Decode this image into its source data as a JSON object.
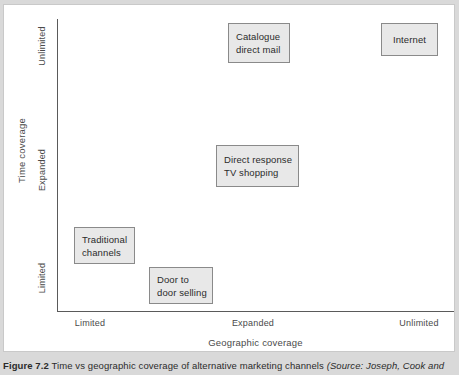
{
  "figure": {
    "caption_label": "Figure 7.2",
    "caption_text": "Time vs geographic coverage of alternative marketing channels",
    "caption_source": "(Source: Joseph, Cook and"
  },
  "chart_data": {
    "type": "scatter",
    "title": "Time vs geographic coverage of alternative marketing channels",
    "xlabel": "Geographic coverage",
    "ylabel": "Time coverage",
    "x_tick_labels": [
      "Limited",
      "Expanded",
      "Unlimited"
    ],
    "y_tick_labels": [
      "Limited",
      "Expanded",
      "Unlimited"
    ],
    "grid": false,
    "legend": "none",
    "points": [
      {
        "label": "Catalogue\ndirect mail",
        "x": "Expanded",
        "y": "Unlimited"
      },
      {
        "label": "Internet",
        "x": "Unlimited",
        "y": "Unlimited"
      },
      {
        "label": "Direct response\nTV shopping",
        "x": "Expanded",
        "y": "Expanded"
      },
      {
        "label": "Traditional\nchannels",
        "x": "Limited",
        "y": "Limited"
      },
      {
        "label": "Door to\ndoor selling",
        "x": "Limited",
        "y": "Limited"
      }
    ]
  },
  "axes": {
    "y_title": "Time coverage",
    "x_title": "Geographic coverage",
    "y_ticks": {
      "unlimited": "Unlimited",
      "expanded": "Expanded",
      "limited": "Limited"
    },
    "x_ticks": {
      "limited": "Limited",
      "expanded": "Expanded",
      "unlimited": "Unlimited"
    }
  },
  "boxes": {
    "catalogue": "Catalogue\ndirect mail",
    "internet": "Internet",
    "direct_response_tv": "Direct response\nTV shopping",
    "traditional": "Traditional\nchannels",
    "door_to_door": "Door to\ndoor selling"
  },
  "colors": {
    "page_background": "#d9d9d9",
    "plate_background": "#ffffff",
    "axis_line": "#5a5a5a",
    "box_fill": "#e8e8e8",
    "box_border": "#8a8a8a",
    "label_text": "#4a4a4a",
    "caption_text": "#2b2b2b"
  }
}
